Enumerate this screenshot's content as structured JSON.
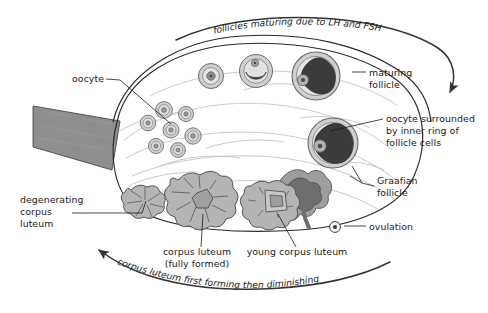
{
  "diagram": {
    "canvas": {
      "width": 488,
      "height": 313,
      "background": "#ffffff"
    }
  },
  "colors": {
    "outline": "#2a2a2a",
    "ovary_fill": "#fbfbfa",
    "stroma_line": "#b9b9b9",
    "ligament_fill": "#8e8e8e",
    "follicle_ring": "#a9a9a9",
    "follicle_fill": "#cfcfcf",
    "antrum_dark": "#3a3a3a",
    "corpus_luteum_fill": "#b4b4b4",
    "text": "#1b1b1b"
  },
  "captions": {
    "top_arc": "follicles maturing due to LH and FSH",
    "bottom_arc": "corpus luteum first forming then diminishing"
  },
  "labels": [
    {
      "id": "oocyte",
      "text": "oocyte",
      "lines": [
        "oocyte"
      ],
      "x": 74,
      "y": 81,
      "anchor": "end"
    },
    {
      "id": "maturing-follicle",
      "text": "maturing follicle",
      "lines": [
        "maturing",
        "follicle"
      ],
      "x": 369,
      "y": 76,
      "anchor": "start"
    },
    {
      "id": "oocyte-surrounded",
      "text": "oocyte surrounded by inner ring of follicle cells",
      "lines": [
        "oocyte surrounded",
        "by inner ring of",
        "follicle cells"
      ],
      "x": 386,
      "y": 122,
      "anchor": "start"
    },
    {
      "id": "graafian-follicle",
      "text": "Graafian follicle",
      "lines": [
        "Graafian",
        "follicle"
      ],
      "x": 377,
      "y": 184,
      "anchor": "start"
    },
    {
      "id": "ovulation",
      "text": "ovulation",
      "lines": [
        "ovulation"
      ],
      "x": 369,
      "y": 228,
      "anchor": "start"
    },
    {
      "id": "degenerating-corpus-luteum",
      "text": "degenerating corpus luteum",
      "lines": [
        "degenerating",
        "corpus",
        "luteum"
      ],
      "x": 20,
      "y": 203,
      "anchor": "start"
    },
    {
      "id": "corpus-luteum-fully-formed",
      "text": "corpus luteum (fully formed)",
      "lines": [
        "corpus luteum",
        "(fully formed)"
      ],
      "x": 197,
      "y": 255,
      "anchor": "middle"
    },
    {
      "id": "young-corpus-luteum",
      "text": "young corpus luteum",
      "lines": [
        "young corpus luteum"
      ],
      "x": 297,
      "y": 255,
      "anchor": "middle"
    }
  ],
  "structures": {
    "ligament": {
      "name": "ovarian ligament / mesovarium",
      "count": 1
    },
    "primordial_oocytes": {
      "name": "primordial follicle cluster",
      "count": 7
    },
    "maturing_follicles": {
      "name": "maturing follicle series",
      "count": 4,
      "stages": [
        "primary",
        "secondary with antrum",
        "tertiary",
        "graafian"
      ]
    },
    "corpora_lutea": {
      "name": "corpus luteum series",
      "count": 3,
      "stages": [
        "young corpus luteum",
        "corpus luteum (fully formed)",
        "degenerating corpus luteum"
      ]
    },
    "ovulation_point": {
      "name": "released ovum at ovulation",
      "count": 1
    }
  }
}
